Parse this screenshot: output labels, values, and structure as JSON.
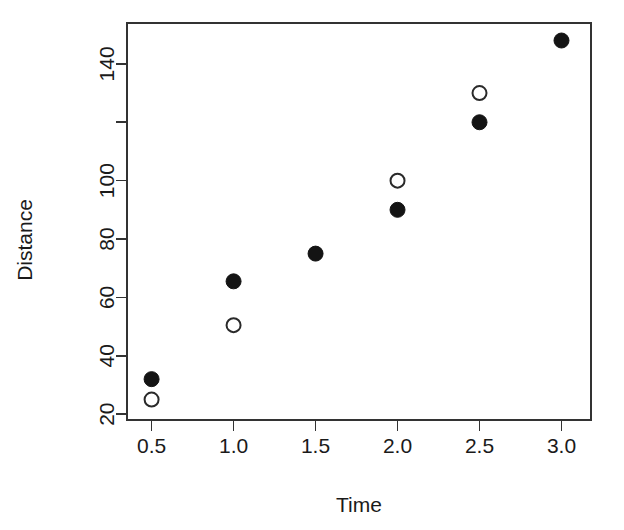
{
  "chart_data": {
    "type": "scatter",
    "title": "",
    "xlabel": "Time",
    "ylabel": "Distance",
    "xlim": [
      0.35,
      3.18
    ],
    "ylim": [
      18,
      154
    ],
    "grid": false,
    "legend": "none",
    "x_ticks": [
      0.5,
      1.0,
      1.5,
      2.0,
      2.5,
      3.0
    ],
    "x_tick_labels": [
      "0.5",
      "1.0",
      "1.5",
      "2.0",
      "2.5",
      "3.0"
    ],
    "y_ticks": [
      20,
      40,
      60,
      80,
      100,
      120,
      140
    ],
    "y_tick_labels": [
      "20",
      "40",
      "60",
      "80",
      "100",
      "",
      "140"
    ],
    "series": [
      {
        "name": "filled",
        "marker": "filled-circle",
        "color": "#141414",
        "points": [
          {
            "x": 0.5,
            "y": 32
          },
          {
            "x": 1.0,
            "y": 65.5
          },
          {
            "x": 1.5,
            "y": 75
          },
          {
            "x": 2.0,
            "y": 90
          },
          {
            "x": 2.5,
            "y": 120
          },
          {
            "x": 3.0,
            "y": 148
          }
        ]
      },
      {
        "name": "open",
        "marker": "open-circle",
        "color": "#2a2a2a",
        "points": [
          {
            "x": 0.5,
            "y": 25
          },
          {
            "x": 1.0,
            "y": 50.5
          },
          {
            "x": 2.0,
            "y": 100
          },
          {
            "x": 2.5,
            "y": 130
          }
        ]
      }
    ]
  },
  "axes": {
    "x_title": "Time",
    "y_title": "Distance"
  }
}
